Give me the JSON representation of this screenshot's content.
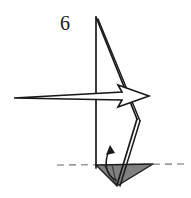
{
  "diagram": {
    "step_number": "6",
    "background_color": "#ffffff",
    "line_color": "#1a1a1a",
    "fill_gray": "#808080",
    "dash_color": "#9a9a9a",
    "canvas": {
      "width": 191,
      "height": 198
    }
  },
  "labels": {
    "step_number": "6",
    "step_number_position": {
      "x": 65,
      "y": 30
    }
  },
  "shapes": {
    "model_outline": {
      "name": "folded-paper-outline",
      "points": "96,17 96,166 137,120 96,17",
      "description": "tall narrow sail-like folded paper body"
    },
    "spine_line": {
      "name": "vertical-spine",
      "from": {
        "x": 96,
        "y": 17
      },
      "to": {
        "x": 96,
        "y": 168
      }
    },
    "right_edge_upper": {
      "name": "upper-right-fold-edge",
      "from": {
        "x": 96,
        "y": 17
      },
      "to": {
        "x": 137,
        "y": 119
      }
    },
    "right_edge_inner": {
      "name": "upper-right-fold-edge-inner",
      "from": {
        "x": 98,
        "y": 19
      },
      "to": {
        "x": 140,
        "y": 121
      }
    },
    "right_edge_lower": {
      "name": "lower-right-fold-edge",
      "from": {
        "x": 137,
        "y": 119
      },
      "to": {
        "x": 117,
        "y": 185
      }
    },
    "right_edge_lower_inner": {
      "name": "lower-right-fold-edge-inner",
      "from": {
        "x": 140,
        "y": 121
      },
      "to": {
        "x": 120,
        "y": 186
      }
    },
    "base_triangle": {
      "name": "shaded-base-triangle",
      "points": "96,165 153,164 117,186",
      "fill": "#808080",
      "stroke": "#1a1a1a"
    },
    "base_triangle_crease_a": {
      "name": "base-crease-left",
      "from": {
        "x": 104,
        "y": 165
      },
      "to": {
        "x": 117,
        "y": 186
      }
    },
    "base_triangle_crease_b": {
      "name": "base-crease-center",
      "from": {
        "x": 112,
        "y": 165
      },
      "to": {
        "x": 117,
        "y": 186
      }
    },
    "dashed_baseline": {
      "name": "horizontal-reference-dashed-line",
      "from": {
        "x": 57,
        "y": 165
      },
      "to": {
        "x": 186,
        "y": 164
      },
      "dash_pattern": "7 5"
    },
    "big_arrow": {
      "name": "process-arrow-right",
      "points": "14,98 122,92 118,85 149,96 118,107 122,100",
      "description": "hollow outline arrow pointing right",
      "fill": "#ffffff",
      "stroke": "#1a1a1a"
    },
    "curved_arrow": {
      "name": "fold-direction-curved-arrow",
      "path": "M 116,180 C 106,176 103,163 110,148",
      "head_points": "110,145 106,155 115,153",
      "description": "small curved arrow indicating upward fold"
    }
  }
}
